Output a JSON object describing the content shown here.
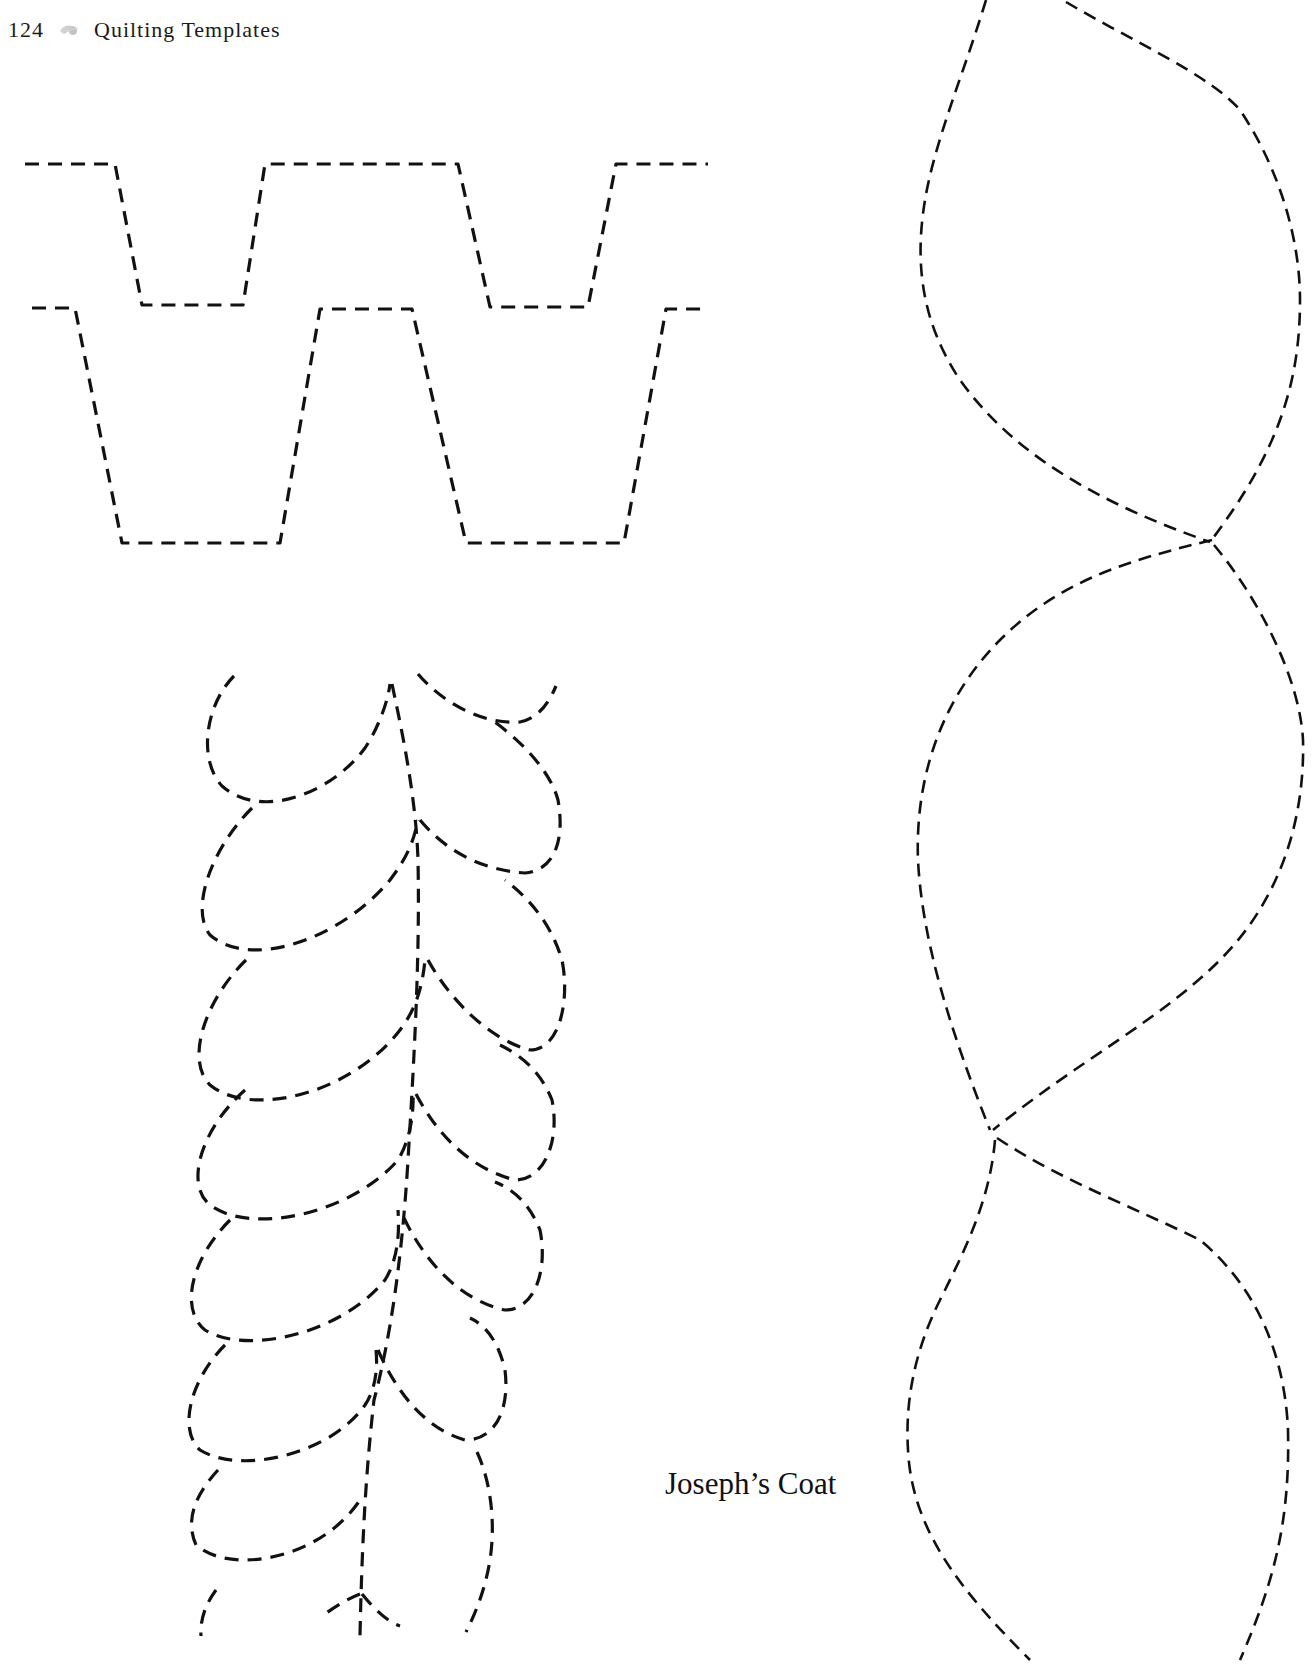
{
  "header": {
    "page_number": "124",
    "ornament_icon": "leaf-ornament-icon",
    "running_title": "Quilting Templates"
  },
  "templates": [
    {
      "id": "zigzag-border",
      "description": "Two staggered rows of dashed trapezoid zig-zag stitching lines",
      "rows": 2,
      "line_style": "dashed"
    },
    {
      "id": "feather-vine",
      "description": "Dashed feather vine with a central spine and alternating teardrop plumes",
      "line_style": "dashed"
    },
    {
      "id": "teardrop-chain",
      "description": "Vertical chain of large interlocking dashed leaf / teardrop shapes",
      "line_style": "dashed"
    }
  ],
  "caption": {
    "text": "Joseph’s Coat"
  },
  "colors": {
    "background": "#ffffff",
    "ink": "#111111",
    "ornament": "#c8c8c8"
  }
}
